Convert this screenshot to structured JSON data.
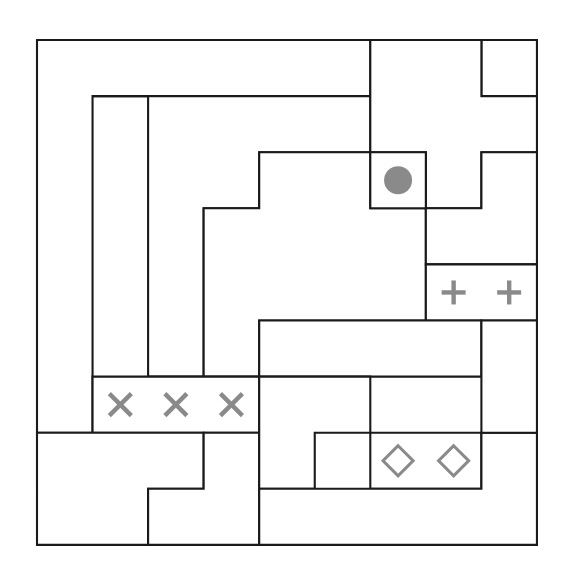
{
  "canvas": {
    "width": 566,
    "height": 582,
    "background": "#ffffff"
  },
  "grid": {
    "name": "region-partition-grid",
    "origin_x": 37,
    "origin_y": 40,
    "cols": 9,
    "rows": 9,
    "cell_width": 55.55,
    "cell_height": 56.1,
    "line_color": "#1a1a1a",
    "line_width": 2.1,
    "fill_color": "#ffffff"
  },
  "regions": [
    {
      "id": "region-outer-ring",
      "name": "outer-L-ring-region",
      "path_cells": "column0-rows0to6 plus row0-all",
      "points": [
        [
          0,
          0
        ],
        [
          9,
          0
        ],
        [
          9,
          1
        ],
        [
          8,
          1
        ],
        [
          8,
          0
        ],
        [
          6,
          0
        ],
        [
          6,
          1
        ],
        [
          1,
          1
        ],
        [
          1,
          7
        ],
        [
          0,
          7
        ]
      ]
    },
    {
      "id": "region-stair-left",
      "name": "left-staircase-region",
      "points": [
        [
          1,
          1
        ],
        [
          6,
          1
        ],
        [
          6,
          2
        ],
        [
          4,
          2
        ],
        [
          4,
          3
        ],
        [
          3,
          3
        ],
        [
          3,
          6
        ],
        [
          2,
          6
        ],
        [
          2,
          1
        ]
      ]
    },
    {
      "id": "region-stair-mid",
      "name": "mid-staircase-region",
      "points": [
        [
          3,
          3
        ],
        [
          4,
          3
        ],
        [
          4,
          2
        ],
        [
          6,
          2
        ],
        [
          6,
          3
        ],
        [
          7,
          3
        ],
        [
          7,
          5
        ],
        [
          4,
          5
        ],
        [
          4,
          6
        ],
        [
          3,
          6
        ]
      ]
    },
    {
      "id": "region-top-notch",
      "name": "top-notch-region",
      "points": [
        [
          6,
          0
        ],
        [
          8,
          0
        ],
        [
          8,
          1
        ],
        [
          9,
          1
        ],
        [
          9,
          2
        ],
        [
          8,
          2
        ],
        [
          8,
          3
        ],
        [
          7,
          3
        ],
        [
          7,
          2
        ],
        [
          6,
          2
        ]
      ]
    },
    {
      "id": "region-dot-cell",
      "name": "marked-dot-region",
      "points": [
        [
          6,
          2
        ],
        [
          7,
          2
        ],
        [
          7,
          3
        ],
        [
          6,
          3
        ]
      ]
    },
    {
      "id": "region-right-upper",
      "name": "right-upper-region",
      "points": [
        [
          8,
          2
        ],
        [
          9,
          2
        ],
        [
          9,
          4
        ],
        [
          7,
          4
        ],
        [
          7,
          3
        ],
        [
          8,
          3
        ]
      ]
    },
    {
      "id": "region-plus-pair",
      "name": "plus-pair-region",
      "points": [
        [
          7,
          4
        ],
        [
          9,
          4
        ],
        [
          9,
          5
        ],
        [
          7,
          5
        ]
      ]
    },
    {
      "id": "region-x-triple",
      "name": "x-triple-region",
      "points": [
        [
          1,
          6
        ],
        [
          4,
          6
        ],
        [
          4,
          7
        ],
        [
          1,
          7
        ]
      ]
    },
    {
      "id": "region-band-mid",
      "name": "mid-band-region",
      "points": [
        [
          4,
          5
        ],
        [
          8,
          5
        ],
        [
          8,
          6
        ],
        [
          4,
          6
        ]
      ]
    },
    {
      "id": "region-lower-left-big",
      "name": "lower-left-big-region",
      "points": [
        [
          0,
          7
        ],
        [
          3,
          7
        ],
        [
          3,
          8
        ],
        [
          2,
          8
        ],
        [
          2,
          9
        ],
        [
          0,
          9
        ]
      ]
    },
    {
      "id": "region-small-square",
      "name": "small-square-region",
      "points": [
        [
          2,
          8
        ],
        [
          3,
          8
        ],
        [
          3,
          7
        ],
        [
          4,
          7
        ],
        [
          4,
          9
        ],
        [
          2,
          9
        ]
      ]
    },
    {
      "id": "region-diamond-pair",
      "name": "diamond-pair-region",
      "points": [
        [
          6,
          7
        ],
        [
          8,
          7
        ],
        [
          8,
          8
        ],
        [
          6,
          8
        ]
      ]
    },
    {
      "id": "region-lower-mid",
      "name": "lower-mid-region",
      "points": [
        [
          4,
          6
        ],
        [
          6,
          6
        ],
        [
          6,
          7
        ],
        [
          5,
          7
        ],
        [
          5,
          8
        ],
        [
          4,
          8
        ]
      ]
    },
    {
      "id": "region-lower-right-block",
      "name": "lower-right-block-region",
      "points": [
        [
          5,
          8
        ],
        [
          8,
          8
        ],
        [
          8,
          7
        ],
        [
          9,
          7
        ],
        [
          9,
          9
        ],
        [
          4,
          9
        ],
        [
          4,
          8
        ]
      ]
    },
    {
      "id": "region-right-side-strip",
      "name": "right-side-strip-region",
      "points": [
        [
          8,
          5
        ],
        [
          9,
          5
        ],
        [
          9,
          7
        ],
        [
          8,
          7
        ]
      ]
    }
  ],
  "markers": [
    {
      "name": "dot-marker",
      "glyph": "filled-circle-icon",
      "symbol": "●",
      "color": "#8a8a8a",
      "col": 6,
      "row": 2,
      "radius": 14
    },
    {
      "name": "plus-marker-1",
      "glyph": "plus-icon",
      "symbol": "+",
      "color": "#8a8a8a",
      "col": 7,
      "row": 4,
      "size": 24
    },
    {
      "name": "plus-marker-2",
      "glyph": "plus-icon",
      "symbol": "+",
      "color": "#8a8a8a",
      "col": 8,
      "row": 4,
      "size": 24
    },
    {
      "name": "x-marker-1",
      "glyph": "cross-x-icon",
      "symbol": "×",
      "color": "#8a8a8a",
      "col": 1,
      "row": 6,
      "size": 22
    },
    {
      "name": "x-marker-2",
      "glyph": "cross-x-icon",
      "symbol": "×",
      "color": "#8a8a8a",
      "col": 2,
      "row": 6,
      "size": 22
    },
    {
      "name": "x-marker-3",
      "glyph": "cross-x-icon",
      "symbol": "×",
      "color": "#8a8a8a",
      "col": 3,
      "row": 6,
      "size": 22
    },
    {
      "name": "diamond-marker-1",
      "glyph": "hollow-diamond-icon",
      "symbol": "◇",
      "color": "#8a8a8a",
      "col": 6,
      "row": 7,
      "size": 15
    },
    {
      "name": "diamond-marker-2",
      "glyph": "hollow-diamond-icon",
      "symbol": "◇",
      "color": "#8a8a8a",
      "col": 7,
      "row": 7,
      "size": 15
    }
  ]
}
